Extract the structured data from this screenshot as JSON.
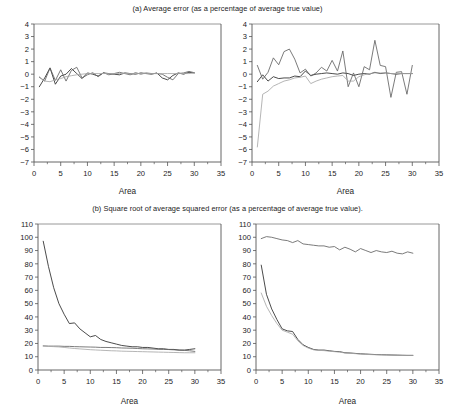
{
  "figure": {
    "width": 455,
    "height": 415,
    "background": "#ffffff"
  },
  "panels": [
    {
      "id": "a",
      "title": "(a) Average error (as a percentage of average true value)"
    },
    {
      "id": "b",
      "title": "(b) Square root of average squared error (as a percentage of average true value)."
    }
  ],
  "colors": {
    "series_dark": "#2b2b2b",
    "series_mid": "#636363",
    "series_light": "#a8a8a8",
    "axis": "#555555",
    "frame_top": "#8c8c8c",
    "text": "#1c1c1c"
  },
  "chart_data": [
    {
      "id": "panel-a-left",
      "type": "line",
      "title": "(a) Average error (as a percentage of average true value)",
      "xlabel": "Area",
      "ylabel": "",
      "xlim": [
        0,
        35
      ],
      "ylim": [
        -7,
        4
      ],
      "xticks": [
        0,
        5,
        10,
        15,
        20,
        25,
        30,
        35
      ],
      "yticks": [
        -7,
        -6,
        -5,
        -4,
        -3,
        -2,
        -1,
        0,
        1,
        2,
        3,
        4
      ],
      "xtick_labels": [
        "0",
        "5",
        "10",
        "15",
        "20",
        "25",
        "30",
        "35"
      ],
      "ytick_labels": [
        "−7",
        "−6",
        "−5",
        "−4",
        "−3",
        "−2",
        "−1",
        "0",
        "1",
        "2",
        "3",
        "4"
      ],
      "minor_xticks": [
        2.5,
        7.5,
        12.5,
        17.5,
        22.5,
        27.5,
        32.5
      ],
      "grid": false,
      "legend": "none",
      "x": [
        1,
        2,
        3,
        4,
        5,
        6,
        7,
        8,
        9,
        10,
        11,
        12,
        13,
        14,
        15,
        16,
        17,
        18,
        19,
        20,
        21,
        22,
        23,
        24,
        25,
        26,
        27,
        28,
        29,
        30
      ],
      "series": [
        {
          "name": "dark",
          "color": "#2b2b2b",
          "values": [
            -1.0,
            -0.3,
            0.5,
            -0.8,
            -0.15,
            0.0,
            0.45,
            0.05,
            -0.35,
            0.1,
            0.0,
            -0.15,
            0.1,
            0.05,
            0.0,
            -0.05,
            0.1,
            0.05,
            0.0,
            0.1,
            0.05,
            0.0,
            0.1,
            -0.3,
            -0.45,
            -0.1,
            0.1,
            0.0,
            0.15,
            0.1
          ]
        },
        {
          "name": "mid",
          "color": "#636363",
          "values": [
            -0.25,
            -0.55,
            0.5,
            -0.5,
            0.35,
            -0.55,
            0.3,
            0.55,
            -0.3,
            -0.05,
            0.12,
            -0.2,
            0.12,
            -0.05,
            0.05,
            0.15,
            0.05,
            -0.05,
            0.12,
            0.0,
            0.1,
            0.05,
            0.05,
            0.0,
            -0.25,
            -0.45,
            0.05,
            0.1,
            0.22,
            0.12
          ]
        },
        {
          "name": "light",
          "color": "#a8a8a8",
          "values": [
            -0.2,
            -0.55,
            -0.6,
            -0.45,
            -0.35,
            -0.2,
            -0.12,
            -0.05,
            0.0,
            0.05,
            0.05,
            0.05,
            0.05,
            0.05,
            0.05,
            0.05,
            0.05,
            0.05,
            0.05,
            0.05,
            0.05,
            0.05,
            0.05,
            0.05,
            0.05,
            0.05,
            0.05,
            0.05,
            0.05,
            0.1
          ]
        }
      ]
    },
    {
      "id": "panel-a-right",
      "type": "line",
      "title": "(a) Average error (as a percentage of average true value)",
      "xlabel": "Area",
      "ylabel": "",
      "xlim": [
        0,
        35
      ],
      "ylim": [
        -7,
        4
      ],
      "xticks": [
        0,
        5,
        10,
        15,
        20,
        25,
        30,
        35
      ],
      "yticks": [
        -7,
        -6,
        -5,
        -4,
        -3,
        -2,
        -1,
        0,
        1,
        2,
        3,
        4
      ],
      "xtick_labels": [
        "0",
        "5",
        "10",
        "15",
        "20",
        "25",
        "30",
        "35"
      ],
      "ytick_labels": [
        "−7",
        "−6",
        "−5",
        "−4",
        "−3",
        "−2",
        "−1",
        "0",
        "1",
        "2",
        "3",
        "4"
      ],
      "minor_xticks": [
        2.5,
        7.5,
        12.5,
        17.5,
        22.5,
        27.5,
        32.5
      ],
      "grid": false,
      "legend": "none",
      "x": [
        1,
        2,
        3,
        4,
        5,
        6,
        7,
        8,
        9,
        10,
        11,
        12,
        13,
        14,
        15,
        16,
        17,
        18,
        19,
        20,
        21,
        22,
        23,
        24,
        25,
        26,
        27,
        28,
        29,
        30
      ],
      "series": [
        {
          "name": "dark",
          "color": "#2b2b2b",
          "values": [
            -0.6,
            -0.05,
            -0.55,
            -0.2,
            -0.35,
            -0.3,
            -0.3,
            -0.15,
            -0.2,
            0.25,
            -0.1,
            0.0,
            0.05,
            0.1,
            0.05,
            0.0,
            0.1,
            0.05,
            -0.1,
            0.0,
            0.05,
            0.0,
            0.15,
            0.05,
            0.1,
            0.05,
            0.0,
            0.05,
            0.05,
            0.05
          ]
        },
        {
          "name": "mid",
          "color": "#636363",
          "values": [
            0.7,
            -0.4,
            0.15,
            1.3,
            0.75,
            1.8,
            2.0,
            1.2,
            0.1,
            0.4,
            -0.15,
            0.1,
            0.55,
            0.25,
            1.1,
            0.25,
            1.85,
            -1.0,
            0.1,
            -1.0,
            0.6,
            0.35,
            2.7,
            0.7,
            0.6,
            -1.85,
            0.15,
            0.2,
            -1.6,
            0.7
          ]
        },
        {
          "name": "light",
          "color": "#a8a8a8",
          "values": [
            -5.8,
            -1.6,
            -1.35,
            -0.95,
            -0.75,
            -0.55,
            -0.45,
            -0.3,
            -0.25,
            -0.15,
            -0.75,
            -0.55,
            -0.4,
            -0.3,
            -0.2,
            -0.15,
            -0.1,
            -0.55,
            -0.55,
            -0.2,
            -0.05,
            0.05,
            0.1,
            0.1,
            0.1,
            0.05,
            0.05,
            0.05,
            0.05,
            0.05
          ]
        }
      ]
    },
    {
      "id": "panel-b-left",
      "type": "line",
      "title": "(b) Square root of average squared error (as a percentage of average true value).",
      "xlabel": "Area",
      "ylabel": "",
      "xlim": [
        0,
        35
      ],
      "ylim": [
        0,
        110
      ],
      "xticks": [
        0,
        5,
        10,
        15,
        20,
        25,
        30,
        35
      ],
      "yticks": [
        0,
        10,
        20,
        30,
        40,
        50,
        60,
        70,
        80,
        90,
        100,
        110
      ],
      "xtick_labels": [
        "0",
        "5",
        "10",
        "15",
        "20",
        "25",
        "30",
        "35"
      ],
      "ytick_labels": [
        "0",
        "10",
        "20",
        "30",
        "40",
        "50",
        "60",
        "70",
        "80",
        "90",
        "100",
        "110"
      ],
      "minor_xticks": [
        2.5,
        7.5,
        12.5,
        17.5,
        22.5,
        27.5,
        32.5
      ],
      "grid": false,
      "legend": "none",
      "x": [
        1,
        2,
        3,
        4,
        5,
        6,
        7,
        8,
        9,
        10,
        11,
        12,
        13,
        14,
        15,
        16,
        17,
        18,
        19,
        20,
        21,
        22,
        23,
        24,
        25,
        26,
        27,
        28,
        29,
        30
      ],
      "series": [
        {
          "name": "dark",
          "color": "#2b2b2b",
          "values": [
            97.0,
            78.0,
            62.0,
            50.0,
            42.0,
            35.0,
            35.5,
            31.0,
            28.0,
            25.0,
            26.0,
            23.0,
            21.5,
            20.5,
            19.5,
            18.5,
            18.0,
            17.5,
            17.5,
            17.0,
            17.0,
            16.5,
            16.0,
            16.0,
            15.5,
            15.5,
            15.0,
            15.0,
            15.5,
            16.0
          ]
        },
        {
          "name": "mid",
          "color": "#636363",
          "values": [
            18.2,
            18.0,
            18.0,
            18.0,
            17.8,
            17.8,
            17.6,
            17.5,
            17.4,
            17.3,
            17.2,
            17.0,
            17.0,
            16.9,
            16.8,
            16.6,
            16.5,
            16.4,
            16.2,
            16.0,
            15.9,
            15.8,
            15.6,
            15.5,
            15.4,
            15.2,
            15.0,
            14.8,
            14.5,
            14.0
          ]
        },
        {
          "name": "light",
          "color": "#a8a8a8",
          "values": [
            18.0,
            17.8,
            17.6,
            17.4,
            17.0,
            16.6,
            16.2,
            15.9,
            15.6,
            15.3,
            15.1,
            14.9,
            14.7,
            14.5,
            14.4,
            14.2,
            14.1,
            14.0,
            13.9,
            13.8,
            13.7,
            13.6,
            13.5,
            13.4,
            13.3,
            13.2,
            13.1,
            13.0,
            13.0,
            13.0
          ]
        }
      ]
    },
    {
      "id": "panel-b-right",
      "type": "line",
      "title": "(b) Square root of average squared error (as a percentage of average true value).",
      "xlabel": "Area",
      "ylabel": "",
      "xlim": [
        0,
        35
      ],
      "ylim": [
        0,
        110
      ],
      "xticks": [
        0,
        5,
        10,
        15,
        20,
        25,
        30,
        35
      ],
      "yticks": [
        0,
        10,
        20,
        30,
        40,
        50,
        60,
        70,
        80,
        90,
        100,
        110
      ],
      "xtick_labels": [
        "0",
        "5",
        "10",
        "15",
        "20",
        "25",
        "30",
        "35"
      ],
      "ytick_labels": [
        "0",
        "10",
        "20",
        "30",
        "40",
        "50",
        "60",
        "70",
        "80",
        "90",
        "100",
        "110"
      ],
      "minor_xticks": [
        2.5,
        7.5,
        12.5,
        17.5,
        22.5,
        27.5,
        32.5
      ],
      "grid": false,
      "legend": "none",
      "x": [
        1,
        2,
        3,
        4,
        5,
        6,
        7,
        8,
        9,
        10,
        11,
        12,
        13,
        14,
        15,
        16,
        17,
        18,
        19,
        20,
        21,
        22,
        23,
        24,
        25,
        26,
        27,
        28,
        29,
        30
      ],
      "series": [
        {
          "name": "top-mid",
          "color": "#636363",
          "values": [
            99.0,
            100.5,
            100.0,
            99.0,
            98.0,
            97.5,
            96.0,
            97.5,
            95.0,
            94.5,
            94.0,
            93.5,
            93.5,
            92.5,
            93.0,
            90.5,
            92.5,
            91.0,
            89.0,
            91.5,
            90.0,
            88.5,
            90.0,
            89.0,
            88.5,
            89.5,
            88.0,
            87.5,
            89.0,
            88.0
          ]
        },
        {
          "name": "dark",
          "color": "#2b2b2b",
          "values": [
            79.0,
            57.0,
            46.0,
            38.0,
            31.0,
            29.5,
            29.0,
            23.0,
            19.0,
            17.0,
            15.5,
            15.0,
            15.0,
            14.5,
            14.0,
            13.8,
            13.0,
            12.8,
            12.5,
            12.2,
            12.0,
            11.8,
            11.6,
            11.5,
            11.4,
            11.3,
            11.2,
            11.1,
            11.0,
            11.0
          ]
        },
        {
          "name": "light",
          "color": "#a8a8a8",
          "values": [
            58.0,
            48.0,
            41.0,
            35.0,
            30.0,
            28.5,
            27.0,
            22.0,
            18.5,
            16.5,
            15.2,
            14.8,
            14.6,
            14.2,
            13.8,
            13.5,
            12.8,
            12.6,
            12.3,
            12.0,
            11.8,
            11.6,
            11.5,
            11.4,
            11.3,
            11.2,
            11.1,
            11.0,
            11.0,
            11.0
          ]
        }
      ]
    }
  ],
  "axis_labels": {
    "x": "Area"
  }
}
